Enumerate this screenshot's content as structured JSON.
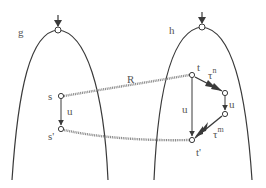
{
  "diagram": {
    "type": "state-transition-bisimulation",
    "colors": {
      "stroke": "#3a3a3a",
      "relation": "#8a8a8a",
      "label": "#555555",
      "background": "#ffffff"
    },
    "trees": [
      {
        "id": "g",
        "label": "g",
        "apex": [
          58,
          30
        ]
      },
      {
        "id": "h",
        "label": "h",
        "apex": [
          202,
          27
        ]
      }
    ],
    "nodes": [
      {
        "id": "g_root",
        "pos": [
          58,
          30
        ]
      },
      {
        "id": "h_root",
        "pos": [
          202,
          27
        ]
      },
      {
        "id": "s",
        "label": "s",
        "pos": [
          61,
          96
        ]
      },
      {
        "id": "s_prime",
        "label": "s'",
        "pos": [
          61,
          129
        ]
      },
      {
        "id": "t",
        "label": "t",
        "pos": [
          192,
          75
        ]
      },
      {
        "id": "t_mid1",
        "pos": [
          225,
          93
        ]
      },
      {
        "id": "t_mid2",
        "pos": [
          225,
          114
        ]
      },
      {
        "id": "t_prime",
        "label": "t'",
        "pos": [
          192,
          140
        ]
      }
    ],
    "edges": [
      {
        "from": "s",
        "to": "s_prime",
        "label": "u",
        "style": "arrow"
      },
      {
        "from": "t",
        "to": "t_prime",
        "label": "u",
        "style": "arrow"
      },
      {
        "from": "t",
        "to": "t_mid1",
        "label": "τ",
        "sup": "n",
        "style": "multi-arrow"
      },
      {
        "from": "t_mid1",
        "to": "t_mid2",
        "label": "u",
        "style": "arrow"
      },
      {
        "from": "t_mid2",
        "to": "t_prime",
        "label": "τ",
        "sup": "m",
        "style": "multi-arrow"
      }
    ],
    "relations": [
      {
        "from": "s",
        "to": "t",
        "label": "R",
        "style": "dotted"
      },
      {
        "from": "s_prime",
        "to": "t_prime",
        "label": "",
        "style": "dotted"
      }
    ]
  },
  "labels": {
    "g": "g",
    "h": "h",
    "R": "R",
    "s": "s",
    "s_prime": "s'",
    "t": "t",
    "t_prime": "t'",
    "u_left": "u",
    "u_mid": "u",
    "u_right": "u",
    "tau_n": "τ",
    "tau_n_sup": "n",
    "tau_m": "τ",
    "tau_m_sup": "m"
  }
}
